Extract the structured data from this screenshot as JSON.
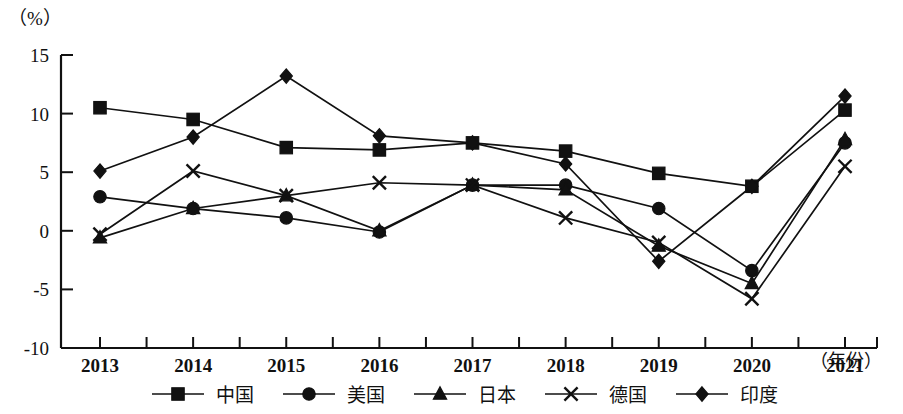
{
  "chart_data": {
    "type": "line",
    "title": "",
    "subtitle": "",
    "unit_label": "（%）",
    "xlabel": "（年份）",
    "ylabel": "",
    "grid": false,
    "legend_position": "bottom",
    "categories": [
      "2013",
      "2014",
      "2015",
      "2016",
      "2017",
      "2018",
      "2019",
      "2020",
      "2021"
    ],
    "x_ticks": [
      "2013",
      "2014",
      "2015",
      "2016",
      "2017",
      "2018",
      "2019",
      "2020",
      "2021"
    ],
    "y_ticks": [
      "15",
      "10",
      "5",
      "0",
      "-5",
      "-10"
    ],
    "ylim": [
      -10,
      15
    ],
    "y_tick_values": [
      15,
      10,
      5,
      0,
      -5,
      -10
    ],
    "series": [
      {
        "name": "中国",
        "marker": "square",
        "values": [
          10.5,
          9.5,
          7.1,
          6.9,
          7.5,
          6.8,
          4.9,
          3.8,
          10.3
        ]
      },
      {
        "name": "美国",
        "marker": "circle",
        "values": [
          2.9,
          1.9,
          1.1,
          -0.1,
          3.9,
          3.9,
          1.9,
          -3.4,
          7.5
        ]
      },
      {
        "name": "日本",
        "marker": "triangle",
        "values": [
          -0.6,
          1.9,
          3.0,
          0.0,
          3.9,
          3.5,
          -1.3,
          -4.5,
          7.8
        ]
      },
      {
        "name": "德国",
        "marker": "cross",
        "values": [
          -0.3,
          5.1,
          3.0,
          4.1,
          3.9,
          1.1,
          -1.0,
          -5.8,
          5.5
        ]
      },
      {
        "name": "印度",
        "marker": "diamond",
        "values": [
          5.1,
          8.0,
          13.2,
          8.1,
          7.5,
          5.7,
          -2.6,
          3.8,
          11.5
        ]
      }
    ],
    "legend": [
      {
        "label": "中国",
        "marker": "square"
      },
      {
        "label": "美国",
        "marker": "circle"
      },
      {
        "label": "日本",
        "marker": "triangle"
      },
      {
        "label": "德国",
        "marker": "cross"
      },
      {
        "label": "印度",
        "marker": "diamond"
      }
    ]
  }
}
